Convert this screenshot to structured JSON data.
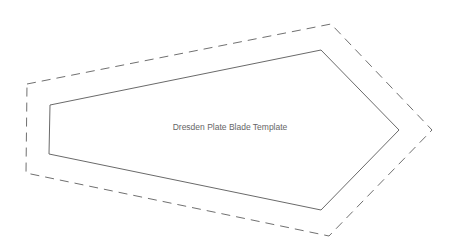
{
  "title": "Dresden Plate Blade Template",
  "colors": {
    "background": "#ffffff",
    "cut_line": "#6a6a6a",
    "seam_line": "#707070",
    "label": "#666666"
  },
  "shapes": {
    "seam_allowance_outline": {
      "style": "dashed",
      "points": "27,84 331,24 432,130 329,236 26,173"
    },
    "blade_outline": {
      "style": "solid",
      "points": "50,105 321,50 399,130 321,210 49,154"
    }
  }
}
